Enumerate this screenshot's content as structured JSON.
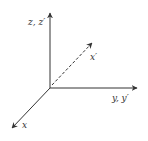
{
  "diagram": {
    "title": "",
    "colors": {
      "axis": "#333333",
      "background": "#ffffff"
    },
    "origin": [
      50,
      88
    ],
    "axes": [
      {
        "id": "z",
        "label": "z, z′",
        "end": [
          50,
          12
        ],
        "style": "solid"
      },
      {
        "id": "y",
        "label": "y, y′",
        "end": [
          138,
          88
        ],
        "style": "solid"
      },
      {
        "id": "x",
        "label": "x",
        "end": [
          11,
          129
        ],
        "style": "solid"
      },
      {
        "id": "x-prime",
        "label": "x′",
        "end": [
          93,
          42
        ],
        "style": "dashed"
      }
    ]
  }
}
